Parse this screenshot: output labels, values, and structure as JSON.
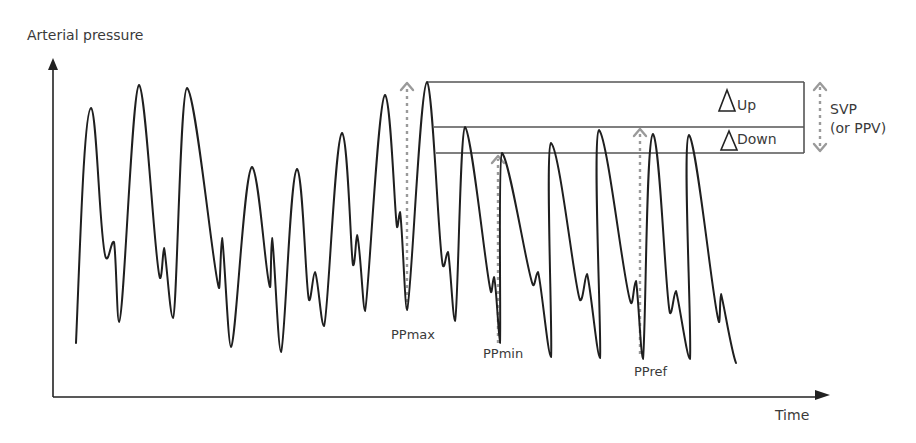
{
  "diagram": {
    "y_axis_label": "Arterial pressure",
    "x_axis_label": "Time",
    "markers": {
      "pp_max": "PPmax",
      "pp_min": "PPmin",
      "pp_ref": "PPref"
    },
    "box": {
      "up_label": "Up",
      "down_label": "Down",
      "delta_symbol": "Δ"
    },
    "svp": {
      "line1": "SVP",
      "line2": "(or PPV)"
    },
    "colors": {
      "waveform": "#1f1f1f",
      "axis": "#222222",
      "box_lines": "#555555",
      "dashed_arrows": "#9a9a9a",
      "text": "#3a3a3a"
    }
  }
}
